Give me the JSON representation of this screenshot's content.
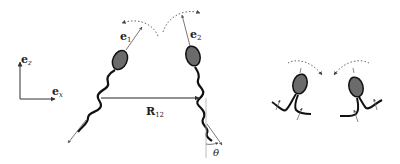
{
  "figure": {
    "axes": {
      "ez_label": "e",
      "ez_sub": "z",
      "ex_label": "e",
      "ex_sub": "x"
    },
    "swimmer1": {
      "orient_label": "e",
      "orient_sub": "1"
    },
    "swimmer2": {
      "orient_label": "e",
      "orient_sub": "2"
    },
    "separation": {
      "label": "R",
      "sub": "12"
    },
    "angle": {
      "label": "θ"
    },
    "colors": {
      "body_fill": "#6b6b6b",
      "stroke": "#111111",
      "arrow": "#555555",
      "dotted": "#666666",
      "guide": "#aaaaaa"
    }
  }
}
